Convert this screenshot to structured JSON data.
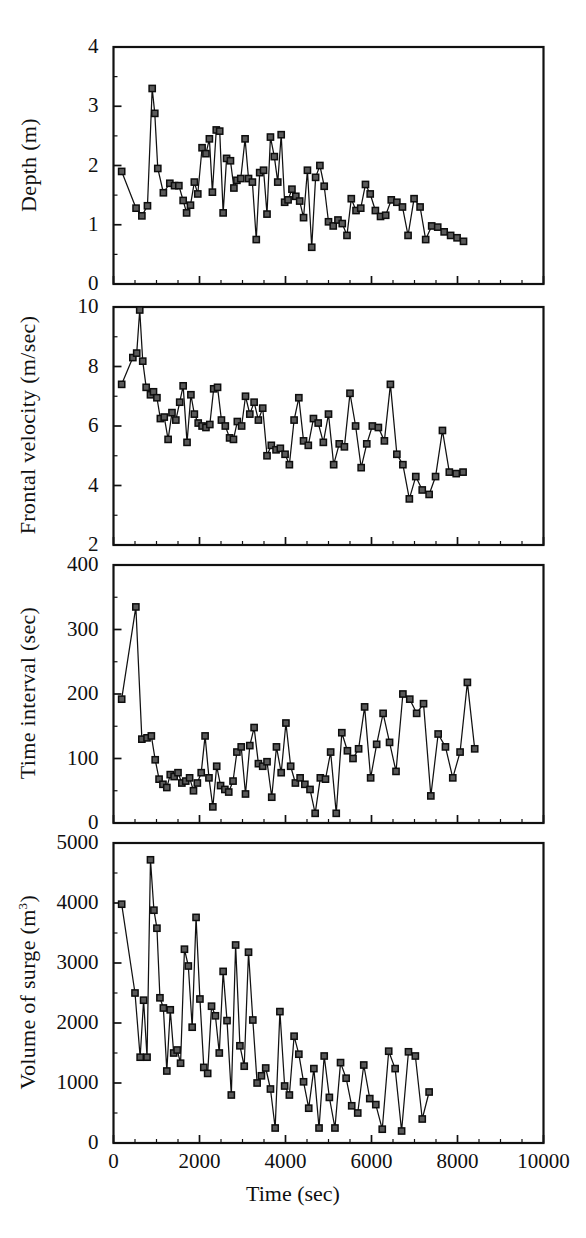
{
  "figure": {
    "title": "",
    "xlabel": "Time (sec)",
    "x_ticks": [
      "0",
      "2000",
      "4000",
      "6000",
      "8000",
      "10000"
    ],
    "xlim": [
      0,
      10000
    ]
  },
  "panels": [
    {
      "id": "depth",
      "ylabel": "Depth (m)",
      "y_ticks": [
        "0",
        "1",
        "2",
        "3",
        "4"
      ],
      "ylim": [
        0,
        4
      ]
    },
    {
      "id": "frontal-velocity",
      "ylabel": "Frontal velocity (m/sec)",
      "y_ticks": [
        "2",
        "4",
        "6",
        "8",
        "10"
      ],
      "ylim": [
        2,
        10
      ]
    },
    {
      "id": "time-interval",
      "ylabel": "Time interval (sec)",
      "y_ticks": [
        "0",
        "100",
        "200",
        "300",
        "400"
      ],
      "ylim": [
        0,
        400
      ]
    },
    {
      "id": "volume-of-surge",
      "ylabel": "Volume of surge (m",
      "ylabel_sup": "3",
      "ylabel_tail": ")",
      "y_ticks": [
        "0",
        "1000",
        "2000",
        "3000",
        "4000",
        "5000"
      ],
      "ylim": [
        0,
        5000
      ]
    }
  ],
  "chart_data": [
    {
      "type": "line",
      "title": "Depth (m) versus Time (sec)",
      "xlabel": "Time (sec)",
      "ylabel": "Depth (m)",
      "xlim": [
        0,
        10000
      ],
      "ylim": [
        0,
        4
      ],
      "x_ticks": [
        0,
        2000,
        4000,
        6000,
        8000,
        10000
      ],
      "y_ticks": [
        0,
        1,
        2,
        3,
        4
      ],
      "grid": false,
      "legend": null,
      "marker": "filled-square",
      "series": [
        {
          "name": "Depth",
          "x": [
            190,
            525,
            660,
            790,
            900,
            960,
            1030,
            1160,
            1310,
            1420,
            1520,
            1620,
            1700,
            1790,
            1880,
            1960,
            2060,
            2150,
            2230,
            2300,
            2390,
            2470,
            2550,
            2630,
            2720,
            2800,
            2870,
            2960,
            3060,
            3140,
            3230,
            3320,
            3400,
            3490,
            3570,
            3650,
            3740,
            3820,
            3900,
            3980,
            4060,
            4150,
            4240,
            4330,
            4420,
            4510,
            4610,
            4700,
            4800,
            4900,
            5000,
            5110,
            5220,
            5320,
            5430,
            5530,
            5640,
            5750,
            5860,
            5970,
            6090,
            6210,
            6330,
            6460,
            6590,
            6720,
            6850,
            6990,
            7130,
            7260,
            7400,
            7540,
            7690,
            7840,
            7990,
            8140,
            8290,
            8400
          ],
          "y": [
            1.9,
            1.28,
            1.15,
            1.32,
            3.3,
            2.88,
            1.95,
            1.54,
            1.7,
            1.66,
            1.66,
            1.41,
            1.2,
            1.33,
            1.72,
            1.52,
            2.3,
            2.2,
            2.45,
            1.55,
            2.6,
            2.58,
            1.2,
            2.12,
            2.08,
            1.62,
            1.75,
            1.78,
            2.45,
            1.78,
            1.72,
            0.75,
            1.88,
            1.92,
            1.18,
            2.48,
            2.15,
            1.72,
            2.52,
            1.38,
            1.42,
            1.6,
            1.48,
            1.4,
            1.12,
            1.92,
            0.62,
            1.8,
            2.0,
            1.65,
            1.05,
            0.98,
            1.08,
            1.02,
            0.82,
            1.44,
            1.24,
            1.28,
            1.68,
            1.52,
            1.24,
            1.14,
            1.16,
            1.42,
            1.38,
            1.3,
            0.82,
            1.44,
            1.3,
            0.75,
            0.98,
            0.96,
            0.88,
            0.82,
            0.78,
            0.72
          ]
        }
      ]
    },
    {
      "type": "line",
      "title": "Frontal velocity (m/sec) versus Time (sec)",
      "xlabel": "Time (sec)",
      "ylabel": "Frontal velocity (m/sec)",
      "xlim": [
        0,
        10000
      ],
      "ylim": [
        2,
        10
      ],
      "x_ticks": [
        0,
        2000,
        4000,
        6000,
        8000,
        10000
      ],
      "y_ticks": [
        2,
        4,
        6,
        8,
        10
      ],
      "grid": false,
      "legend": null,
      "marker": "filled-square",
      "series": [
        {
          "name": "Frontal velocity",
          "x": [
            190,
            450,
            540,
            610,
            680,
            760,
            860,
            930,
            1010,
            1090,
            1180,
            1270,
            1360,
            1450,
            1540,
            1620,
            1710,
            1800,
            1880,
            1970,
            2060,
            2150,
            2240,
            2330,
            2420,
            2510,
            2600,
            2700,
            2790,
            2880,
            2980,
            3070,
            3170,
            3270,
            3370,
            3470,
            3570,
            3670,
            3780,
            3880,
            3990,
            4090,
            4200,
            4310,
            4420,
            4530,
            4650,
            4760,
            4880,
            5000,
            5120,
            5250,
            5370,
            5500,
            5630,
            5760,
            5890,
            6020,
            6160,
            6300,
            6440,
            6590,
            6730,
            6880,
            7030,
            7180,
            7340,
            7490,
            7650,
            7810,
            7970,
            8130
          ],
          "y": [
            7.4,
            8.3,
            8.45,
            9.9,
            8.18,
            7.3,
            7.05,
            7.15,
            6.95,
            6.25,
            6.3,
            5.55,
            6.45,
            6.2,
            6.8,
            7.35,
            5.45,
            7.05,
            6.4,
            6.1,
            6.0,
            5.95,
            6.05,
            7.25,
            7.3,
            6.2,
            6.0,
            5.6,
            5.55,
            6.15,
            6.0,
            7.0,
            6.4,
            6.8,
            6.2,
            6.6,
            5.0,
            5.35,
            5.2,
            5.25,
            5.05,
            4.7,
            6.2,
            6.95,
            5.5,
            5.35,
            6.25,
            6.1,
            5.45,
            6.4,
            4.7,
            5.4,
            5.3,
            7.1,
            6.0,
            4.6,
            5.4,
            6.0,
            5.95,
            5.5,
            7.4,
            5.05,
            4.7,
            3.55,
            4.3,
            3.85,
            3.7,
            4.3,
            5.85,
            4.45,
            4.4,
            4.45,
            2.95,
            4.85
          ]
        }
      ]
    },
    {
      "type": "line",
      "title": "Time interval (sec) versus Time (sec)",
      "xlabel": "Time (sec)",
      "ylabel": "Time interval (sec)",
      "xlim": [
        0,
        10000
      ],
      "ylim": [
        0,
        400
      ],
      "x_ticks": [
        0,
        2000,
        4000,
        6000,
        8000,
        10000
      ],
      "y_ticks": [
        0,
        100,
        200,
        300,
        400
      ],
      "grid": false,
      "legend": null,
      "marker": "filled-square",
      "series": [
        {
          "name": "Time interval",
          "x": [
            190,
            520,
            660,
            780,
            880,
            970,
            1060,
            1150,
            1240,
            1320,
            1410,
            1500,
            1590,
            1680,
            1770,
            1860,
            1950,
            2040,
            2130,
            2220,
            2310,
            2400,
            2490,
            2590,
            2680,
            2780,
            2870,
            2970,
            3070,
            3170,
            3270,
            3370,
            3470,
            3570,
            3680,
            3790,
            3900,
            4010,
            4120,
            4230,
            4340,
            4450,
            4570,
            4690,
            4810,
            4930,
            5050,
            5180,
            5310,
            5440,
            5570,
            5700,
            5840,
            5980,
            6120,
            6270,
            6420,
            6570,
            6730,
            6890,
            7050,
            7210,
            7380,
            7550,
            7720,
            7890,
            8060,
            8230,
            8400
          ],
          "y": [
            192,
            335,
            130,
            132,
            135,
            98,
            68,
            60,
            55,
            75,
            72,
            78,
            62,
            65,
            70,
            50,
            62,
            78,
            135,
            70,
            25,
            88,
            58,
            52,
            48,
            65,
            110,
            118,
            45,
            120,
            148,
            92,
            88,
            95,
            40,
            118,
            78,
            155,
            88,
            62,
            70,
            60,
            52,
            15,
            70,
            68,
            110,
            15,
            140,
            112,
            100,
            115,
            180,
            70,
            122,
            170,
            125,
            80,
            200,
            192,
            170,
            185,
            42,
            138,
            118,
            70,
            110,
            218,
            115,
            60,
            290,
            150,
            25,
            22,
            148,
            318,
            32,
            112
          ]
        }
      ]
    },
    {
      "type": "line",
      "title": "Volume of surge (m^3) versus Time (sec)",
      "xlabel": "Time (sec)",
      "ylabel": "Volume of surge (m3)",
      "xlim": [
        0,
        10000
      ],
      "ylim": [
        0,
        5000
      ],
      "x_ticks": [
        0,
        2000,
        4000,
        6000,
        8000,
        10000
      ],
      "y_ticks": [
        0,
        1000,
        2000,
        3000,
        4000,
        5000
      ],
      "grid": false,
      "legend": null,
      "marker": "filled-square",
      "series": [
        {
          "name": "Volume of surge",
          "x": [
            190,
            500,
            620,
            700,
            780,
            860,
            940,
            1010,
            1080,
            1160,
            1240,
            1320,
            1400,
            1480,
            1560,
            1650,
            1740,
            1830,
            1920,
            2010,
            2100,
            2190,
            2280,
            2370,
            2460,
            2550,
            2640,
            2740,
            2840,
            2940,
            3040,
            3140,
            3240,
            3340,
            3440,
            3540,
            3650,
            3760,
            3870,
            3980,
            4090,
            4200,
            4310,
            4420,
            4540,
            4660,
            4780,
            4900,
            5020,
            5150,
            5280,
            5410,
            5540,
            5680,
            5820,
            5960,
            6100,
            6250,
            6400,
            6550,
            6700,
            6860,
            7020,
            7180,
            7340,
            7500,
            7670,
            7840,
            8010,
            8180,
            8330
          ],
          "y": [
            3980,
            2500,
            1430,
            2380,
            1430,
            4720,
            3880,
            3580,
            2420,
            2250,
            1200,
            2220,
            1500,
            1550,
            1330,
            3230,
            2950,
            1930,
            3760,
            2400,
            1260,
            1160,
            2280,
            2120,
            1500,
            2860,
            2040,
            800,
            3300,
            1620,
            1280,
            3180,
            2050,
            1000,
            1120,
            1250,
            900,
            250,
            2190,
            950,
            800,
            1780,
            1480,
            1020,
            580,
            1240,
            250,
            1450,
            760,
            250,
            1340,
            1080,
            620,
            500,
            1300,
            740,
            640,
            230,
            1530,
            1240,
            200,
            1520,
            1450,
            400,
            850
          ]
        }
      ]
    }
  ]
}
